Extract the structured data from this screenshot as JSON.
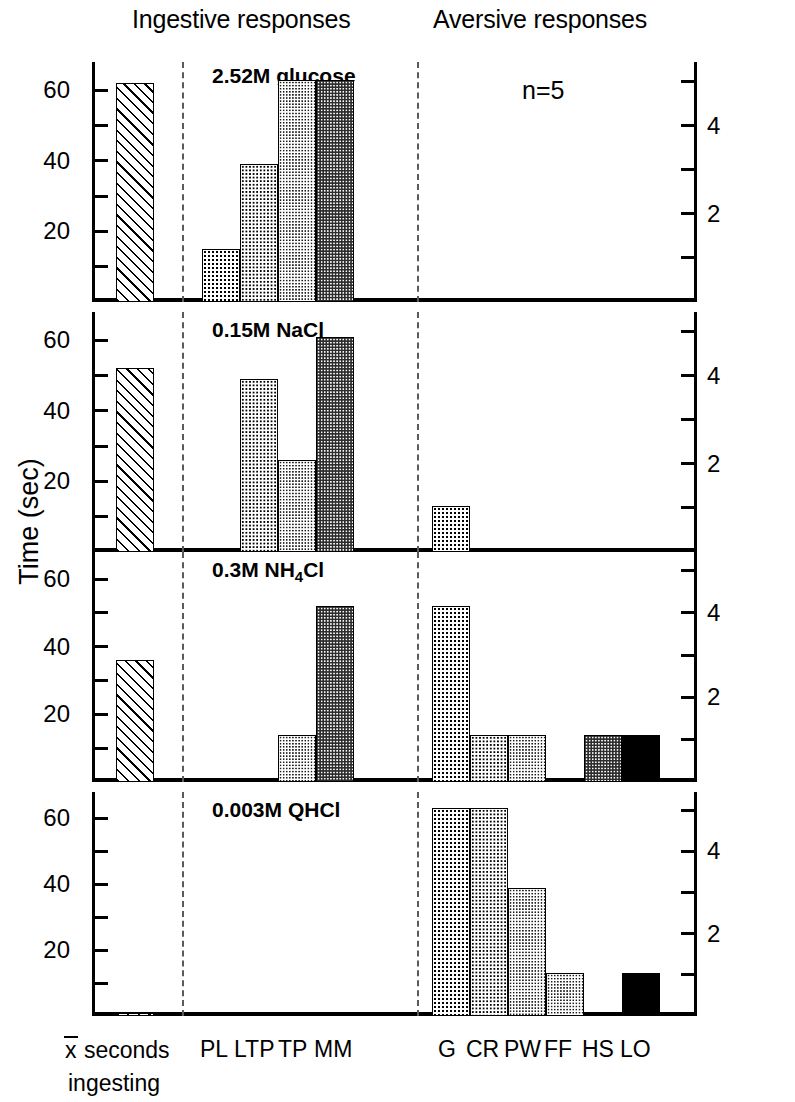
{
  "header": {
    "ingestive": "Ingestive responses",
    "aversive": "Aversive responses"
  },
  "axes": {
    "left_title": "Time (sec)",
    "right_title": "Number of rats showing components",
    "left_ticks": [
      10,
      20,
      30,
      40,
      50,
      60
    ],
    "left_labeled": [
      "20",
      "40",
      "60"
    ],
    "right_ticks": [
      1,
      2,
      3,
      4,
      5
    ],
    "right_labeled": [
      "2",
      "4"
    ],
    "left_max": 68,
    "right_max": 5.44
  },
  "annotation": {
    "n": "n=5"
  },
  "categories": {
    "mean": "x seconds ingesting",
    "mean_line1": "x seconds",
    "mean_line2": "ingesting",
    "ingestive": [
      "PL",
      "LTP",
      "TP",
      "MM"
    ],
    "aversive": [
      "G",
      "CR",
      "PW",
      "FF",
      "HS",
      "LO"
    ]
  },
  "chart_data": {
    "type": "bar",
    "xlabel": "",
    "ylabel": "Time (sec)",
    "y2label": "Number of rats showing components",
    "ylim": [
      0,
      68
    ],
    "y2lim": [
      0,
      5.44
    ],
    "grid": false,
    "legend": "none",
    "note": "n=5",
    "group_headers": [
      "Ingestive responses",
      "Aversive responses"
    ],
    "categories": [
      "x seconds ingesting",
      "PL",
      "LTP",
      "TP",
      "MM",
      "G",
      "CR",
      "PW",
      "FF",
      "HS",
      "LO"
    ],
    "panels": [
      {
        "title": "2.52M glucose",
        "values": {
          "x seconds ingesting": 62,
          "PL": 15,
          "LTP": 39,
          "TP": 63,
          "MM": 63,
          "G": 0,
          "CR": 0,
          "PW": 0,
          "FF": 0,
          "HS": 0,
          "LO": 0
        }
      },
      {
        "title": "0.15M NaCl",
        "values": {
          "x seconds ingesting": 52,
          "PL": 0,
          "LTP": 49,
          "TP": 26,
          "MM": 61,
          "G": 13,
          "CR": 0,
          "PW": 0,
          "FF": 0,
          "HS": 0,
          "LO": 0
        }
      },
      {
        "title": "0.3M NH4Cl",
        "title_parts": [
          "0.3M NH",
          "4",
          "Cl"
        ],
        "values": {
          "x seconds ingesting": 36,
          "PL": 0,
          "LTP": 0,
          "TP": 14,
          "MM": 52,
          "G": 52,
          "CR": 14,
          "PW": 14,
          "FF": 0,
          "HS": 14,
          "LO": 14
        }
      },
      {
        "title": "0.003M QHCl",
        "values": {
          "x seconds ingesting": 1,
          "PL": 0,
          "LTP": 0,
          "TP": 0,
          "MM": 0,
          "G": 63,
          "CR": 63,
          "PW": 39,
          "FF": 13,
          "HS": 0,
          "LO": 13
        }
      }
    ]
  }
}
